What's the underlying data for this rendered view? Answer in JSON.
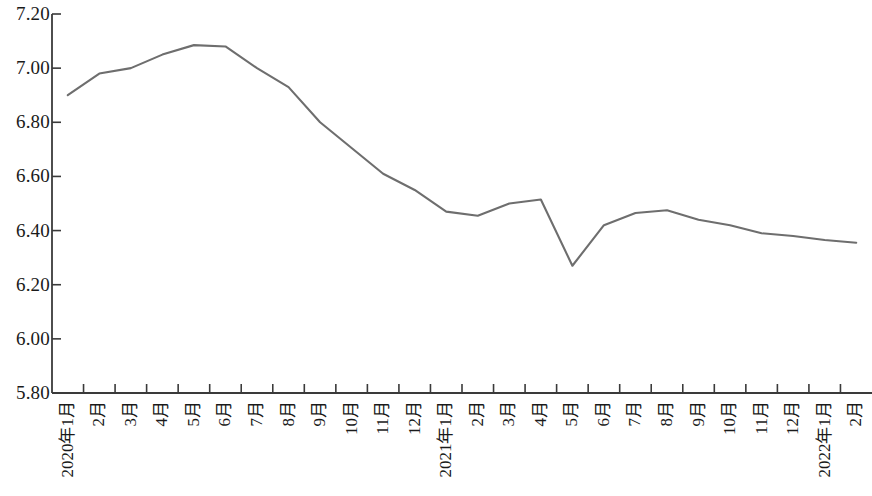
{
  "chart_data": {
    "type": "line",
    "title": "",
    "subtitle": "",
    "xlabel": "",
    "ylabel": "",
    "grid": false,
    "legend": false,
    "legend_position": "none",
    "line_color": "#6e6e6e",
    "axis_color": "#3a3a3a",
    "background_color": "#ffffff",
    "ylim": [
      5.8,
      7.2
    ],
    "ytick_labels": [
      "7.20",
      "7.00",
      "6.80",
      "6.60",
      "6.40",
      "6.20",
      "6.00",
      "5.80"
    ],
    "ytick_values": [
      7.2,
      7.0,
      6.8,
      6.6,
      6.4,
      6.2,
      6.0,
      5.8
    ],
    "categories": [
      "2020年1月",
      "2月",
      "3月",
      "4月",
      "5月",
      "6月",
      "7月",
      "8月",
      "9月",
      "10月",
      "11月",
      "12月",
      "2021年1月",
      "2月",
      "3月",
      "4月",
      "5月",
      "6月",
      "7月",
      "8月",
      "9月",
      "10月",
      "11月",
      "12月",
      "2022年1月",
      "2月"
    ],
    "values": [
      6.9,
      6.98,
      7.0,
      7.05,
      7.085,
      7.08,
      7.0,
      6.93,
      6.8,
      6.705,
      6.61,
      6.55,
      6.47,
      6.455,
      6.5,
      6.515,
      6.27,
      6.42,
      6.465,
      6.475,
      6.44,
      6.42,
      6.39,
      6.38,
      6.365,
      6.355
    ],
    "series": [
      {
        "name": "",
        "values": [
          6.9,
          6.98,
          7.0,
          7.05,
          7.085,
          7.08,
          7.0,
          6.93,
          6.8,
          6.705,
          6.61,
          6.55,
          6.47,
          6.455,
          6.5,
          6.515,
          6.27,
          6.42,
          6.465,
          6.475,
          6.44,
          6.42,
          6.39,
          6.38,
          6.365,
          6.355
        ]
      }
    ]
  }
}
